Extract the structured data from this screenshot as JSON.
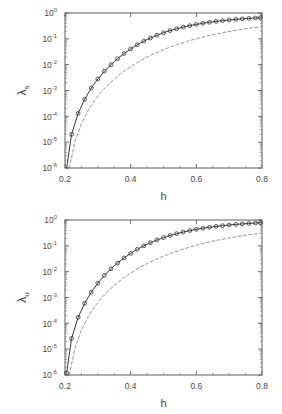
{
  "figure": {
    "panels": [
      {
        "id": "panel-lambda-s",
        "ylabel_symbol": "λ",
        "ylabel_sub": "s",
        "xlabel": "h"
      },
      {
        "id": "panel-lambda-u",
        "ylabel_symbol": "λ",
        "ylabel_sub": "u",
        "xlabel": "h"
      }
    ],
    "xticklabels": [
      "0.2",
      "0.4",
      "0.6",
      "0.8"
    ],
    "yticklabels": [
      "10",
      "10",
      "10",
      "10",
      "10",
      "10",
      "10"
    ],
    "yticklabel_exponents": [
      "0",
      "-1",
      "-2",
      "-3",
      "-4",
      "-5",
      "-6"
    ],
    "colors": {
      "axis": "#6b6b6b",
      "curve_solid": "#3a3a3a",
      "curve_dashed": "#8a8a8a",
      "marker_edge": "#3a3a3a",
      "background": "#ffffff"
    }
  },
  "chart_data": [
    {
      "type": "line",
      "title": "",
      "xlabel": "h",
      "ylabel": "λ_s",
      "xlim": [
        0.2,
        0.8
      ],
      "ylim": [
        1e-06,
        1.0
      ],
      "yscale": "log",
      "xscale": "linear",
      "grid": false,
      "legend": null,
      "xticks": [
        0.2,
        0.4,
        0.6,
        0.8
      ],
      "yticks": [
        1,
        0.1,
        0.01,
        0.001,
        0.0001,
        1e-05,
        1e-06
      ],
      "series": [
        {
          "name": "numerical (solid with circle markers)",
          "style": "solid-with-open-circles",
          "x": [
            0.205,
            0.22,
            0.24,
            0.26,
            0.28,
            0.3,
            0.32,
            0.34,
            0.36,
            0.38,
            0.4,
            0.42,
            0.44,
            0.46,
            0.48,
            0.5,
            0.52,
            0.54,
            0.56,
            0.58,
            0.6,
            0.62,
            0.64,
            0.66,
            0.68,
            0.7,
            0.72,
            0.74,
            0.76,
            0.78,
            0.795
          ],
          "y": [
            1e-06,
            2e-05,
            0.00013,
            0.00046,
            0.00125,
            0.0028,
            0.0056,
            0.01,
            0.017,
            0.027,
            0.041,
            0.059,
            0.082,
            0.108,
            0.138,
            0.172,
            0.208,
            0.245,
            0.284,
            0.323,
            0.362,
            0.4,
            0.437,
            0.472,
            0.505,
            0.537,
            0.566,
            0.593,
            0.618,
            0.641,
            0.655
          ]
        },
        {
          "name": "analytic approximation (dashed)",
          "style": "dashed",
          "x": [
            0.213,
            0.23,
            0.25,
            0.27,
            0.29,
            0.31,
            0.33,
            0.35,
            0.37,
            0.39,
            0.41,
            0.43,
            0.45,
            0.47,
            0.49,
            0.51,
            0.53,
            0.55,
            0.57,
            0.59,
            0.61,
            0.63,
            0.65,
            0.67,
            0.69,
            0.71,
            0.73,
            0.75,
            0.77,
            0.795
          ],
          "y": [
            1e-06,
            1e-05,
            5.2e-05,
            0.000165,
            0.00041,
            0.00086,
            0.00162,
            0.0028,
            0.0045,
            0.0069,
            0.0101,
            0.0143,
            0.0196,
            0.026,
            0.0337,
            0.0428,
            0.053,
            0.065,
            0.078,
            0.093,
            0.109,
            0.126,
            0.144,
            0.163,
            0.183,
            0.203,
            0.224,
            0.245,
            0.266,
            0.29
          ]
        }
      ]
    },
    {
      "type": "line",
      "title": "",
      "xlabel": "h",
      "ylabel": "λ_u",
      "xlim": [
        0.2,
        0.8
      ],
      "ylim": [
        1e-06,
        1.0
      ],
      "yscale": "log",
      "xscale": "linear",
      "grid": false,
      "legend": null,
      "xticks": [
        0.2,
        0.4,
        0.6,
        0.8
      ],
      "yticks": [
        1,
        0.1,
        0.01,
        0.001,
        0.0001,
        1e-05,
        1e-06
      ],
      "series": [
        {
          "name": "numerical (solid with circle markers)",
          "style": "solid-with-open-circles",
          "x": [
            0.205,
            0.22,
            0.24,
            0.26,
            0.28,
            0.3,
            0.32,
            0.34,
            0.36,
            0.38,
            0.4,
            0.42,
            0.44,
            0.46,
            0.48,
            0.5,
            0.52,
            0.54,
            0.56,
            0.58,
            0.6,
            0.62,
            0.64,
            0.66,
            0.68,
            0.7,
            0.72,
            0.74,
            0.76,
            0.78,
            0.795
          ],
          "y": [
            1.2e-06,
            2.6e-05,
            0.00017,
            0.0006,
            0.0016,
            0.0036,
            0.0072,
            0.013,
            0.0215,
            0.034,
            0.051,
            0.073,
            0.1,
            0.132,
            0.168,
            0.208,
            0.251,
            0.296,
            0.342,
            0.389,
            0.435,
            0.48,
            0.524,
            0.565,
            0.604,
            0.641,
            0.675,
            0.707,
            0.736,
            0.763,
            0.78
          ]
        },
        {
          "name": "analytic approximation (dashed)",
          "style": "dashed",
          "x": [
            0.213,
            0.23,
            0.25,
            0.27,
            0.29,
            0.31,
            0.33,
            0.35,
            0.37,
            0.39,
            0.41,
            0.43,
            0.45,
            0.47,
            0.49,
            0.51,
            0.53,
            0.55,
            0.57,
            0.59,
            0.61,
            0.63,
            0.65,
            0.67,
            0.69,
            0.71,
            0.73,
            0.75,
            0.77,
            0.795
          ],
          "y": [
            1e-06,
            1.05e-05,
            5.5e-05,
            0.000175,
            0.00044,
            0.00092,
            0.00172,
            0.00295,
            0.00475,
            0.00725,
            0.0106,
            0.015,
            0.0205,
            0.0272,
            0.0352,
            0.0446,
            0.0555,
            0.068,
            0.0815,
            0.097,
            0.114,
            0.132,
            0.151,
            0.171,
            0.191,
            0.213,
            0.235,
            0.257,
            0.28,
            0.305
          ]
        }
      ]
    }
  ]
}
